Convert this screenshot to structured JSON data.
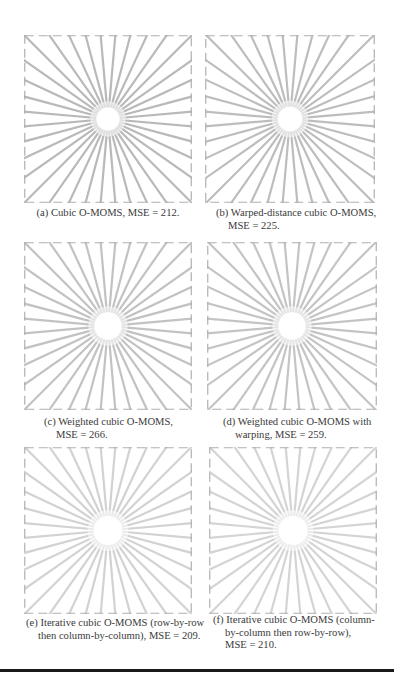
{
  "figure": {
    "panels": [
      {
        "id": "a",
        "caption_lines": [
          "(a) Cubic O-MOMS, MSE = 212."
        ],
        "mse": 212,
        "method": "Cubic O-MOMS",
        "line_color": "#b9b9b9",
        "center_blur": 0.55
      },
      {
        "id": "b",
        "caption_lines": [
          "(b) Warped-distance cubic O-MOMS,",
          "MSE = 225."
        ],
        "mse": 225,
        "method": "Warped-distance cubic O-MOMS",
        "line_color": "#bdbdbd",
        "center_blur": 0.6
      },
      {
        "id": "c",
        "caption_lines": [
          "(c) Weighted cubic O-MOMS,",
          "MSE = 266."
        ],
        "mse": 266,
        "method": "Weighted cubic O-MOMS",
        "line_color": "#c2c2c2",
        "center_blur": 0.7
      },
      {
        "id": "d",
        "caption_lines": [
          "(d) Weighted cubic O-MOMS with",
          "warping, MSE = 259."
        ],
        "mse": 259,
        "method": "Weighted cubic O-MOMS with warping",
        "line_color": "#c4c4c4",
        "center_blur": 0.7
      },
      {
        "id": "e",
        "caption_lines": [
          "(e) Iterative cubic O-MOMS (row-by-row",
          "then column-by-column), MSE = 209."
        ],
        "mse": 209,
        "method": "Iterative cubic O-MOMS (row-by-row then column-by-column)",
        "line_color": "#d2d2d2",
        "center_blur": 0.75
      },
      {
        "id": "f",
        "caption_lines": [
          "(f) Iterative cubic O-MOMS (column-",
          "by-column then row-by-row),",
          "MSE = 210."
        ],
        "mse": 210,
        "method": "Iterative cubic O-MOMS (column-by-column then row-by-row)",
        "line_color": "#d4d4d4",
        "center_blur": 0.75
      }
    ],
    "pattern": {
      "type": "starburst",
      "ray_count": 36,
      "frame_border_color": "#b0b0b0"
    }
  }
}
